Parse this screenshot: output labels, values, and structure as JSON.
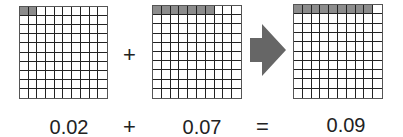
{
  "grids": [
    {
      "id": "grid-a",
      "shaded": 2,
      "value_label": "0.02"
    },
    {
      "id": "grid-b",
      "shaded": 7,
      "value_label": "0.07"
    },
    {
      "id": "grid-sum",
      "shaded": 9,
      "value_label": "0.09"
    }
  ],
  "top_operator": "+",
  "equation": {
    "left": "0.02",
    "plus": "+",
    "right": "0.07",
    "equals": "=",
    "result": "0.09"
  },
  "icons": {
    "arrow": "right-arrow-icon"
  },
  "colors": {
    "shaded": "#8c8c8c",
    "grid_line": "#222222",
    "arrow": "#666666"
  }
}
